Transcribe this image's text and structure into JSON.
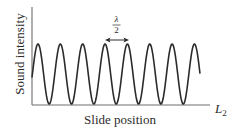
{
  "figure": {
    "ylabel": "Sound intensity",
    "xlabel": "Slide position",
    "x_axis_end_label": "L",
    "x_axis_end_subscript": "2",
    "annotation": {
      "numerator": "λ",
      "denominator": "2",
      "meaning": "distance between adjacent maxima",
      "arrow": "double-headed"
    },
    "colors": {
      "curve": "#2b2b2b",
      "axes": "#6e6e6e",
      "text": "#2b2b2b"
    }
  },
  "chart_data": {
    "type": "line",
    "title": "",
    "xlabel": "Slide position",
    "ylabel": "Sound intensity",
    "x_end_label": "L2",
    "series": [
      {
        "name": "Sound intensity vs slide position",
        "shape": "periodic sinusoid",
        "num_maxima": 8,
        "num_minima": 7,
        "minima_touch_zero": true,
        "spacing_between_maxima": "λ/2"
      }
    ],
    "annotations": [
      "λ/2 (double-headed arrow between 4th and 5th maxima)"
    ],
    "grid": false,
    "ticks": false
  }
}
